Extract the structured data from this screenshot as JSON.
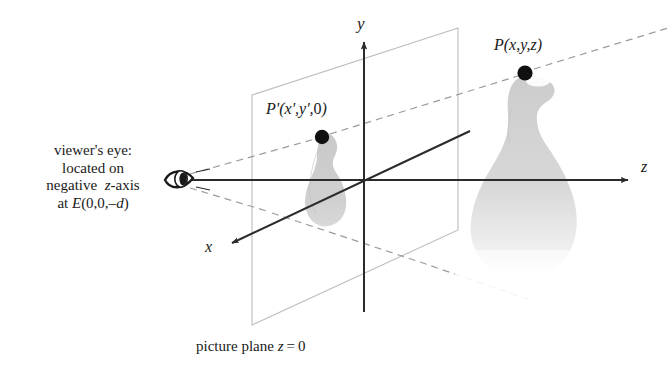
{
  "figure": {
    "labels": {
      "viewer_line1": "viewer's eye:",
      "viewer_line2": "located on",
      "viewer_line3": "negative  z-axis",
      "viewer_line4": "at E(0,0,–d)",
      "point_projected": "P'(x',y',0)",
      "point_world": "P(x,y,z)",
      "axis_y": "y",
      "axis_z": "z",
      "axis_x": "x",
      "picture_plane": "picture plane z = 0"
    },
    "colors": {
      "background": "#ffffff",
      "ink": "#1a1a1a",
      "axis": "#2b2b2b",
      "plane_edge": "#b6b6b6",
      "dashed_ray": "#9a9a9a",
      "object_fill": "#c9c9c9",
      "object_fill_light": "#dedede",
      "dot": "#101010"
    },
    "geometry": {
      "origin": [
        365,
        180
      ],
      "eye": [
        180,
        180
      ],
      "point_projected_dot": [
        322,
        137
      ],
      "point_world_dot": [
        525,
        73
      ],
      "plane_left_edge_x": 252,
      "plane_right_edge_x": 458,
      "y_axis_x": 364,
      "z_axis_y": 180
    }
  }
}
